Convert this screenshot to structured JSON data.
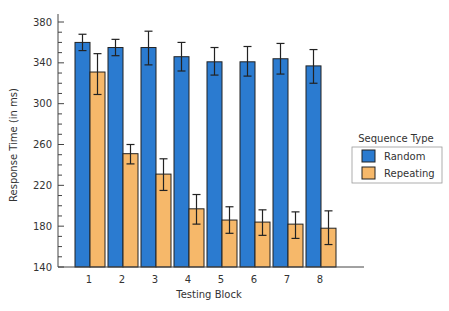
{
  "chart_data": {
    "type": "bar",
    "title": "",
    "xlabel": "Testing Block",
    "ylabel": "Response Time (in ms)",
    "ylim": [
      140,
      380
    ],
    "yticks": [
      140,
      180,
      220,
      260,
      300,
      340,
      380
    ],
    "yminor_step": 10,
    "grid": false,
    "categories": [
      "1",
      "2",
      "3",
      "4",
      "5",
      "6",
      "7",
      "8"
    ],
    "series": [
      {
        "name": "Random",
        "color": "#2b7bd0",
        "values": [
          360,
          355,
          355,
          346,
          341,
          341,
          344,
          337
        ],
        "error_low": [
          352,
          347,
          338,
          332,
          328,
          327,
          329,
          320
        ],
        "error_high": [
          368,
          363,
          371,
          360,
          355,
          356,
          359,
          353
        ]
      },
      {
        "name": "Repeating",
        "color": "#f6b86a",
        "values": [
          331,
          251,
          231,
          197,
          186,
          184,
          182,
          178
        ],
        "error_low": [
          309,
          241,
          215,
          182,
          173,
          171,
          168,
          162
        ],
        "error_high": [
          349,
          260,
          246,
          211,
          199,
          196,
          194,
          195
        ]
      }
    ],
    "legend": {
      "title": "Sequence Type",
      "position": "right",
      "entries": [
        "Random",
        "Repeating"
      ]
    }
  }
}
